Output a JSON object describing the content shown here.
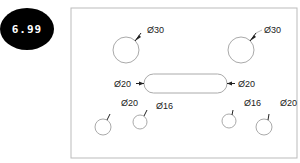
{
  "badge": {
    "value": "6.99"
  },
  "drawing": {
    "plate": {
      "x": 71,
      "y": 8,
      "width": 226,
      "height": 150,
      "stroke": "#bbbbbb"
    },
    "slot": {
      "x": 144,
      "y": 74,
      "width": 83,
      "height": 19
    },
    "holes": [
      {
        "id": "top-left",
        "cx": 126,
        "cy": 50,
        "r": 13,
        "label": "Ø30",
        "lx": 147,
        "ly": 33
      },
      {
        "id": "top-right",
        "cx": 241,
        "cy": 50,
        "r": 13,
        "label": "Ø30",
        "lx": 264,
        "ly": 33
      },
      {
        "id": "bottom-left-large",
        "cx": 103,
        "cy": 127,
        "r": 8,
        "label": "Ø20",
        "lx": 121,
        "ly": 106
      },
      {
        "id": "bottom-left-small",
        "cx": 140,
        "cy": 122,
        "r": 7,
        "label": "Ø16",
        "lx": 156,
        "ly": 109
      },
      {
        "id": "bottom-right-small",
        "cx": 229,
        "cy": 121,
        "r": 7,
        "label": "Ø16",
        "lx": 246,
        "ly": 106
      },
      {
        "id": "bottom-right-large",
        "cx": 263,
        "cy": 127,
        "r": 8,
        "label": "Ø20",
        "lx": 281,
        "ly": 106
      }
    ],
    "slot_labels": {
      "left": "Ø20",
      "right": "Ø20"
    }
  }
}
